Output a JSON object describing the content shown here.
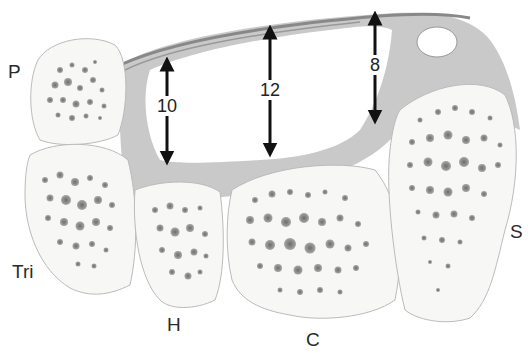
{
  "figure": {
    "bones": [
      {
        "id": "P",
        "label": "P"
      },
      {
        "id": "Tri",
        "label": "Tri"
      },
      {
        "id": "H",
        "label": "H"
      },
      {
        "id": "C",
        "label": "C"
      },
      {
        "id": "S",
        "label": "S"
      }
    ],
    "measurements": [
      {
        "label": "10"
      },
      {
        "label": "12"
      },
      {
        "label": "8"
      }
    ],
    "colors": {
      "background": "#ffffff",
      "bone_fill": "#f7f7f5",
      "soft_tissue": "#c9c9c9",
      "ligament": "#888888",
      "arrow": "#111111",
      "text": "#2a2a2a"
    }
  }
}
